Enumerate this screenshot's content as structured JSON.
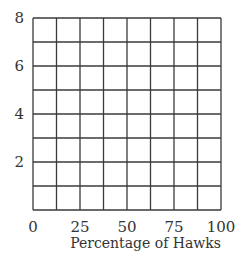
{
  "chart_data": {
    "type": "line",
    "title": "",
    "xlabel": "Percentage of Hawks",
    "ylabel": "",
    "xlim": [
      0,
      100
    ],
    "ylim": [
      0,
      8
    ],
    "x_ticks": [
      0,
      25,
      50,
      75,
      100
    ],
    "y_ticks": [
      2,
      4,
      6,
      8
    ],
    "x_tick_labels": [
      "0",
      "25",
      "50",
      "75",
      "100"
    ],
    "y_tick_labels": [
      "2",
      "4",
      "6",
      "8"
    ],
    "grid": true,
    "grid_x_step": 12.5,
    "grid_y_step": 1,
    "series": [],
    "legend": null
  },
  "colors": {
    "grid": "#3a3a3a",
    "text": "#333333",
    "background": "#ffffff"
  }
}
